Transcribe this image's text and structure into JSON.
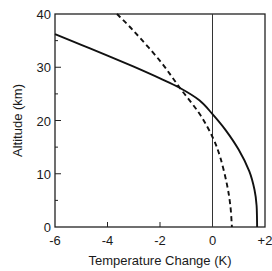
{
  "chart_data": {
    "type": "line",
    "title": "",
    "xlabel": "Temperature Change (K)",
    "ylabel": "Altitude (km)",
    "xlim": [
      -6,
      2
    ],
    "ylim": [
      0,
      40
    ],
    "xticks": [
      -6,
      -4,
      -2,
      0,
      2
    ],
    "xtick_labels": [
      "-6",
      "-4",
      "-2",
      "0",
      "+2"
    ],
    "yticks": [
      0,
      10,
      20,
      30,
      40
    ],
    "ytick_labels": [
      "0",
      "10",
      "20",
      "30",
      "40"
    ],
    "y_minor_ticks": [
      5,
      15,
      25,
      35
    ],
    "grid": false,
    "reference_line": {
      "x": 0,
      "orientation": "vertical"
    },
    "series": [
      {
        "name": "solid",
        "style": "solid",
        "points": [
          [
            -6.0,
            36.2
          ],
          [
            -5.0,
            34.2
          ],
          [
            -4.0,
            32.2
          ],
          [
            -3.0,
            30.1
          ],
          [
            -2.0,
            27.9
          ],
          [
            -1.24,
            26.1
          ],
          [
            -0.5,
            23.8
          ],
          [
            0.0,
            21.2
          ],
          [
            0.5,
            18.2
          ],
          [
            1.0,
            14.5
          ],
          [
            1.4,
            10.5
          ],
          [
            1.6,
            7.0
          ],
          [
            1.68,
            4.0
          ],
          [
            1.7,
            0.0
          ]
        ]
      },
      {
        "name": "dashed",
        "style": "dashed",
        "points": [
          [
            -3.64,
            40.0
          ],
          [
            -3.0,
            36.8
          ],
          [
            -2.0,
            31.2
          ],
          [
            -1.24,
            26.1
          ],
          [
            -0.5,
            21.3
          ],
          [
            0.0,
            16.9
          ],
          [
            0.3,
            13.0
          ],
          [
            0.55,
            8.0
          ],
          [
            0.68,
            4.0
          ],
          [
            0.74,
            0.0
          ]
        ]
      }
    ]
  }
}
